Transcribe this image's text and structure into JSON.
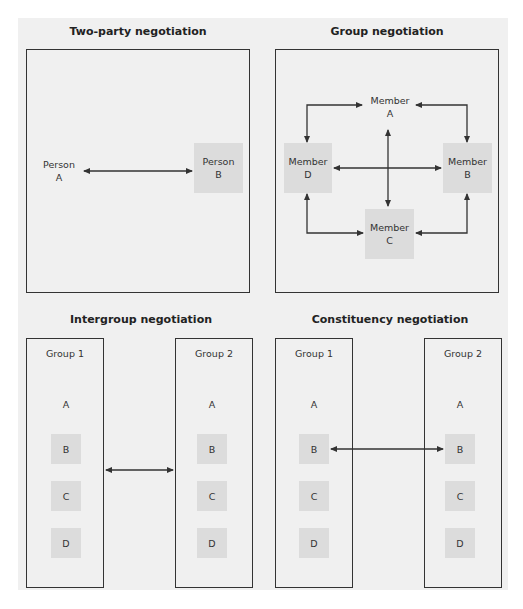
{
  "colors": {
    "background": "#f0f0f0",
    "shaded_box": "#dcdcdc",
    "line": "#333333"
  },
  "two_party": {
    "title": "Two-party negotiation",
    "person_a": "Person\nA",
    "person_b": "Person\nB"
  },
  "group": {
    "title": "Group negotiation",
    "member_a": "Member\nA",
    "member_b": "Member\nB",
    "member_c": "Member\nC",
    "member_d": "Member\nD"
  },
  "intergroup": {
    "title": "Intergroup negotiation",
    "group1": {
      "label": "Group 1",
      "members": [
        "A",
        "B",
        "C",
        "D"
      ]
    },
    "group2": {
      "label": "Group 2",
      "members": [
        "A",
        "B",
        "C",
        "D"
      ]
    }
  },
  "constituency": {
    "title": "Constituency negotiation",
    "group1": {
      "label": "Group 1",
      "members": [
        "A",
        "B",
        "C",
        "D"
      ]
    },
    "group2": {
      "label": "Group 2",
      "members": [
        "A",
        "B",
        "C",
        "D"
      ]
    }
  }
}
